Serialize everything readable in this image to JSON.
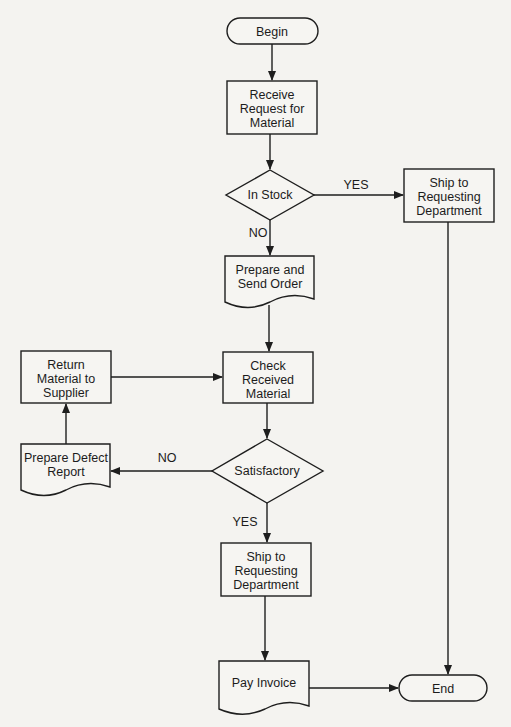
{
  "diagram": {
    "type": "flowchart",
    "colors": {
      "background": "#f4f3f0",
      "stroke": "#1e1e1e",
      "text": "#1c1c1c"
    },
    "nodes": {
      "begin": {
        "shape": "terminator",
        "lines": [
          "Begin"
        ]
      },
      "receive_request": {
        "shape": "process",
        "lines": [
          "Receive",
          "Request for",
          "Material"
        ]
      },
      "in_stock": {
        "shape": "decision",
        "lines": [
          "In Stock"
        ]
      },
      "ship_right": {
        "shape": "process",
        "lines": [
          "Ship to",
          "Requesting",
          "Department"
        ]
      },
      "prepare_order": {
        "shape": "document",
        "lines": [
          "Prepare and",
          "Send Order"
        ]
      },
      "check_material": {
        "shape": "process",
        "lines": [
          "Check",
          "Received",
          "Material"
        ]
      },
      "return_material": {
        "shape": "process",
        "lines": [
          "Return",
          "Material to",
          "Supplier"
        ]
      },
      "satisfactory": {
        "shape": "decision",
        "lines": [
          "Satisfactory"
        ]
      },
      "defect_report": {
        "shape": "document",
        "lines": [
          "Prepare Defect",
          "Report"
        ]
      },
      "ship_bottom": {
        "shape": "process",
        "lines": [
          "Ship to",
          "Requesting",
          "Department"
        ]
      },
      "pay_invoice": {
        "shape": "document",
        "lines": [
          "Pay Invoice"
        ]
      },
      "end": {
        "shape": "terminator",
        "lines": [
          "End"
        ]
      }
    },
    "edge_labels": {
      "in_stock_yes": "YES",
      "in_stock_no": "NO",
      "satisfactory_no": "NO",
      "satisfactory_yes": "YES"
    },
    "edges": [
      {
        "from": "begin",
        "to": "receive_request"
      },
      {
        "from": "receive_request",
        "to": "in_stock"
      },
      {
        "from": "in_stock",
        "to": "ship_right",
        "label": "YES"
      },
      {
        "from": "in_stock",
        "to": "prepare_order",
        "label": "NO"
      },
      {
        "from": "ship_right",
        "to": "end"
      },
      {
        "from": "prepare_order",
        "to": "check_material"
      },
      {
        "from": "check_material",
        "to": "satisfactory"
      },
      {
        "from": "satisfactory",
        "to": "defect_report",
        "label": "NO"
      },
      {
        "from": "defect_report",
        "to": "return_material"
      },
      {
        "from": "return_material",
        "to": "check_material"
      },
      {
        "from": "satisfactory",
        "to": "ship_bottom",
        "label": "YES"
      },
      {
        "from": "ship_bottom",
        "to": "pay_invoice"
      },
      {
        "from": "pay_invoice",
        "to": "end"
      }
    ]
  }
}
